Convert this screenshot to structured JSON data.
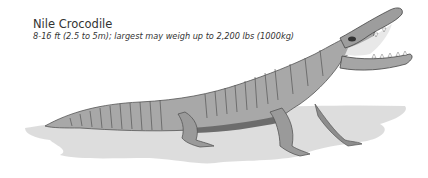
{
  "caption": {
    "title": "Nile Crocodile",
    "subtitle": "8-16 ft (2.5 to 5m); largest may weigh up to 2,200 lbs (1000kg)"
  },
  "illustration": {
    "subject": "crocodile-illustration",
    "style": "grayscale pencil sketch",
    "colors": {
      "shadow": "#d6d6d6",
      "body": "#9a9a9a",
      "outline": "#4a4a4a",
      "background": "#ffffff"
    }
  }
}
